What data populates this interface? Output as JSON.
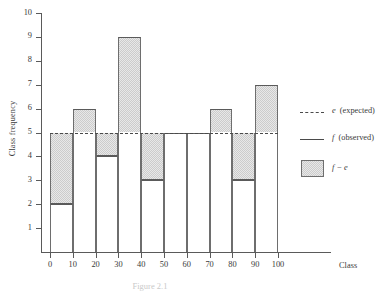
{
  "figure": {
    "caption": "Figure 2.1"
  },
  "axes": {
    "y_title": "Class frequency",
    "x_title": "Class",
    "y_ticks": [
      "1",
      "2",
      "3",
      "4",
      "5",
      "6",
      "7",
      "8",
      "9",
      "10"
    ],
    "x_ticks": [
      "0",
      "10",
      "20",
      "30",
      "40",
      "50",
      "60",
      "70",
      "80",
      "90",
      "100"
    ]
  },
  "legend": {
    "expected": {
      "symbol": "e",
      "label": "(expected)",
      "marker": "dashed-line"
    },
    "observed": {
      "symbol": "f",
      "label": "(observed)",
      "marker": "solid-line"
    },
    "difference": {
      "symbol": "f − e",
      "label": "",
      "marker": "shaded-swatch"
    }
  },
  "colors": {
    "shade_fill": "#cccccc",
    "outline": "#6e6e6e",
    "axis": "#5a5a5a",
    "background": "#ffffff"
  },
  "chart_data": {
    "type": "bar",
    "title": "",
    "xlabel": "Class",
    "ylabel": "Class frequency",
    "categories": [
      "0-10",
      "10-20",
      "20-30",
      "30-40",
      "40-50",
      "50-60",
      "60-70",
      "70-80",
      "80-90",
      "90-100"
    ],
    "bin_edges": [
      0,
      10,
      20,
      30,
      40,
      50,
      60,
      70,
      80,
      90,
      100
    ],
    "series": [
      {
        "name": "f (observed)",
        "values": [
          2,
          6,
          4,
          9,
          3,
          5,
          5,
          6,
          3,
          7
        ]
      },
      {
        "name": "e (expected)",
        "values": [
          5,
          5,
          5,
          5,
          5,
          5,
          5,
          5,
          5,
          5
        ]
      }
    ],
    "differences": [
      -3,
      1,
      -1,
      4,
      -2,
      0,
      0,
      1,
      -2,
      2
    ],
    "expected_value": 5,
    "xlim": [
      0,
      100
    ],
    "ylim": [
      0,
      10
    ],
    "ytick_step": 1,
    "xtick_step": 10,
    "grid": false,
    "legend_position": "right"
  }
}
